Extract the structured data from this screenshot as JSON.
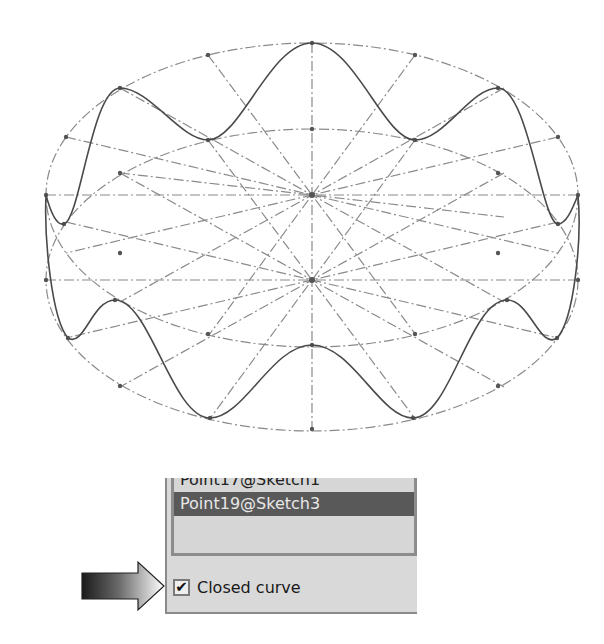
{
  "sketch": {
    "description": "3D sketch of closed wavy curve wrapped between two construction ellipses",
    "curve_color": "#4a4a4a",
    "construction_color": "#8a8a8a"
  },
  "panel": {
    "list_items": [
      {
        "label": "Point17@Sketch1",
        "selected": false
      },
      {
        "label": "Point19@Sketch3",
        "selected": true
      }
    ],
    "closed_curve": {
      "label": "Closed curve",
      "checked": true,
      "check_glyph": "✔"
    }
  },
  "callout": {
    "icon": "arrow-right-icon"
  }
}
